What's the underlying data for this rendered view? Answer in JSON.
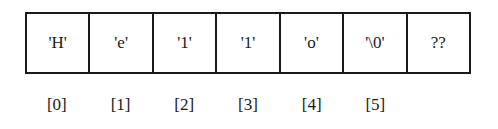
{
  "diagram": {
    "type": "char-array",
    "cells": [
      {
        "value": "'H'"
      },
      {
        "value": "'e'"
      },
      {
        "value": "'1'"
      },
      {
        "value": "'1'"
      },
      {
        "value": "'o'"
      },
      {
        "value": "'\\0'"
      },
      {
        "value": "??"
      }
    ],
    "indices": [
      "[0]",
      "[1]",
      "[2]",
      "[3]",
      "[4]",
      "[5]"
    ]
  }
}
